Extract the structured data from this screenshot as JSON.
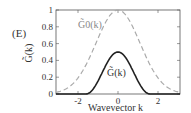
{
  "panel_label": "(E)",
  "chart_data": {
    "type": "line",
    "title": "",
    "xlabel": "Wavevector k",
    "ylabel": "G̃(k)",
    "xlim": [
      -3.1,
      3.1
    ],
    "ylim": [
      0,
      1
    ],
    "xticks": [
      -2,
      0,
      2
    ],
    "yticks": [
      0,
      0.2,
      0.4,
      0.6,
      0.8,
      1
    ],
    "ytick_labels": [
      "0",
      "0.2",
      "0.4",
      "0.6",
      "0.8",
      "1"
    ],
    "xtick_labels": [
      "-2",
      "0",
      "2"
    ],
    "grid": false,
    "series": [
      {
        "name": "G̃0(k)",
        "style": "dashed",
        "color": "#aaaaaa",
        "x": [
          -3.1,
          -2.5,
          -2.0,
          -1.5,
          -1.0,
          -0.5,
          0,
          0.5,
          1.0,
          1.5,
          2.0,
          2.5,
          3.1
        ],
        "y": [
          0.0,
          0.06,
          0.2,
          0.42,
          0.68,
          0.9,
          1.0,
          0.9,
          0.68,
          0.42,
          0.2,
          0.06,
          0.0
        ]
      },
      {
        "name": "G̃(k)",
        "style": "solid",
        "color": "#222222",
        "x": [
          -3.1,
          -1.6,
          -1.2,
          -0.8,
          -0.4,
          0,
          0.4,
          0.8,
          1.2,
          1.6,
          3.1
        ],
        "y": [
          0,
          0,
          0.05,
          0.2,
          0.4,
          0.5,
          0.4,
          0.2,
          0.05,
          0,
          0
        ]
      }
    ],
    "annotations": [
      {
        "text": "G̃0(k)",
        "x": -1.5,
        "y": 0.78
      },
      {
        "text": "G̃(k)",
        "x": 0,
        "y": 0.2
      }
    ]
  }
}
